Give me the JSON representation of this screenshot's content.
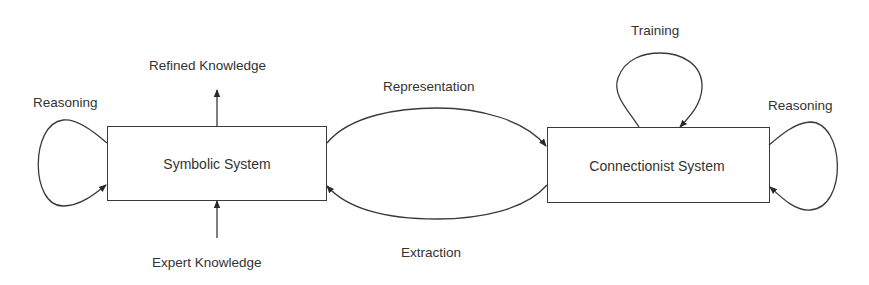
{
  "diagram": {
    "nodes": {
      "symbolic": {
        "label": "Symbolic System"
      },
      "connectionist": {
        "label": "Connectionist System"
      }
    },
    "edges": {
      "symbolic_reasoning": {
        "label": "Reasoning",
        "from": "Symbolic System",
        "to": "Symbolic System"
      },
      "refined_knowledge": {
        "label": "Refined Knowledge",
        "from": "Symbolic System",
        "to": "output"
      },
      "expert_knowledge": {
        "label": "Expert Knowledge",
        "from": "input",
        "to": "Symbolic System"
      },
      "representation": {
        "label": "Representation",
        "from": "Symbolic System",
        "to": "Connectionist System"
      },
      "extraction": {
        "label": "Extraction",
        "from": "Connectionist System",
        "to": "Symbolic System"
      },
      "training": {
        "label": "Training",
        "from": "Connectionist System",
        "to": "Connectionist System"
      },
      "connectionist_reasoning": {
        "label": "Reasoning",
        "from": "Connectionist System",
        "to": "Connectionist System"
      }
    },
    "colors": {
      "stroke": "#3a3a3a",
      "text": "#333333",
      "background": "#ffffff"
    }
  }
}
